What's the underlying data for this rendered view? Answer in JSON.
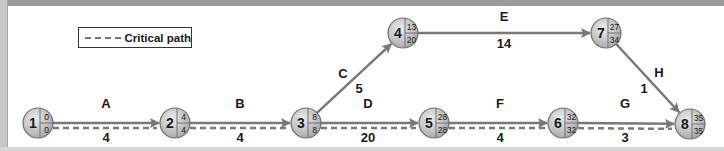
{
  "legend": {
    "label": "Critical path"
  },
  "colors": {
    "arrow": "#787878",
    "critical_dash": "#7a7a7a",
    "node_fill_light": "#e2e2e2",
    "node_fill_dark": "#a9a9a9",
    "node_stroke": "#707070",
    "text": "#1a1a1a"
  },
  "nodes": [
    {
      "id": "1",
      "early": "0",
      "late": "0"
    },
    {
      "id": "2",
      "early": "4",
      "late": "4"
    },
    {
      "id": "3",
      "early": "8",
      "late": "8"
    },
    {
      "id": "4",
      "early": "13",
      "late": "20"
    },
    {
      "id": "5",
      "early": "28",
      "late": "28"
    },
    {
      "id": "6",
      "early": "32",
      "late": "32"
    },
    {
      "id": "7",
      "early": "27",
      "late": "34"
    },
    {
      "id": "8",
      "early": "35",
      "late": "35"
    }
  ],
  "activities": [
    {
      "name": "A",
      "from": "1",
      "to": "2",
      "duration": "4",
      "critical": true
    },
    {
      "name": "B",
      "from": "2",
      "to": "3",
      "duration": "4",
      "critical": true
    },
    {
      "name": "C",
      "from": "3",
      "to": "4",
      "duration": "5",
      "critical": false
    },
    {
      "name": "D",
      "from": "3",
      "to": "5",
      "duration": "20",
      "critical": true
    },
    {
      "name": "E",
      "from": "4",
      "to": "7",
      "duration": "14",
      "critical": false
    },
    {
      "name": "F",
      "from": "5",
      "to": "6",
      "duration": "4",
      "critical": true
    },
    {
      "name": "G",
      "from": "6",
      "to": "8",
      "duration": "3",
      "critical": true
    },
    {
      "name": "H",
      "from": "7",
      "to": "8",
      "duration": "1",
      "critical": false
    }
  ]
}
